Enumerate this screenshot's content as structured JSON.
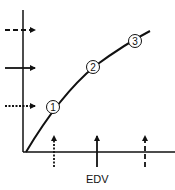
{
  "diagram": {
    "x_axis_label": "EDV",
    "points": [
      {
        "label": "1",
        "cx": 53,
        "cy": 107
      },
      {
        "label": "2",
        "cx": 93,
        "cy": 67
      },
      {
        "label": "3",
        "cx": 135,
        "cy": 41
      }
    ],
    "left_arrows": [
      {
        "style": "dashed",
        "y": 30
      },
      {
        "style": "solid",
        "y": 68
      },
      {
        "style": "dotted",
        "y": 106
      }
    ],
    "bottom_arrows": [
      {
        "style": "dotted",
        "x": 54
      },
      {
        "style": "solid",
        "x": 97
      },
      {
        "style": "dashed",
        "x": 145
      }
    ],
    "colors": {
      "ink": "#111111",
      "background": "#ffffff"
    }
  }
}
